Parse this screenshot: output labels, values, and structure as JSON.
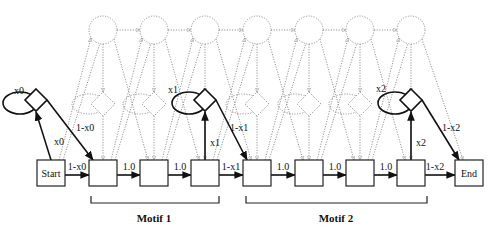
{
  "diagram": {
    "type": "profile HMM / motif state diagram",
    "start_label": "Start",
    "end_label": "End",
    "match_state_count": 7,
    "insert_state_count": 7,
    "delete_state_count": 7,
    "silent_diamonds": [
      {
        "id": "d0",
        "loop_label": "x0",
        "up_label": "x0",
        "down_label": "1-x0"
      },
      {
        "id": "d1",
        "loop_label": "x1",
        "up_label": "x1",
        "down_label": "1-x1"
      },
      {
        "id": "d2",
        "loop_label": "x2",
        "up_label": "x2",
        "down_label": "1-x2"
      }
    ],
    "edges": [
      {
        "from": "Start",
        "to": "m1",
        "label": "1-x0"
      },
      {
        "from": "m1",
        "to": "m2",
        "label": "1.0"
      },
      {
        "from": "m2",
        "to": "m3",
        "label": "1.0"
      },
      {
        "from": "m3",
        "to": "m4",
        "label": "1-x1"
      },
      {
        "from": "m4",
        "to": "m5",
        "label": "1.0"
      },
      {
        "from": "m5",
        "to": "m6",
        "label": "1.0"
      },
      {
        "from": "m6",
        "to": "m7",
        "label": "1.0"
      },
      {
        "from": "m7",
        "to": "End",
        "label": "1-x2"
      }
    ],
    "motifs": [
      {
        "label": "Motif 1",
        "spans": [
          "m1",
          "m2",
          "m3"
        ]
      },
      {
        "label": "Motif 2",
        "spans": [
          "m4",
          "m5",
          "m6",
          "m7"
        ]
      }
    ]
  }
}
